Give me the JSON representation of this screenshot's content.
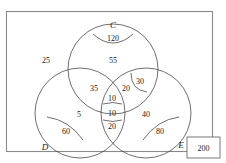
{
  "diagram": {
    "type": "venn-three-set",
    "universe_label": "",
    "sets": [
      {
        "id": "C",
        "label": "C",
        "label_x": 113,
        "label_y": 28
      },
      {
        "id": "D",
        "label": "D",
        "label_x": 45,
        "label_y": 150
      },
      {
        "id": "E",
        "label": "E",
        "label_x": 181,
        "label_y": 148
      }
    ],
    "outside_value": "25",
    "outside_x": 46,
    "outside_y": 63,
    "total_box": {
      "value": "200",
      "x": 187,
      "y": 137,
      "width": 33,
      "height": 21
    },
    "regions": [
      {
        "name": "c-cap",
        "value": "120",
        "x": 113,
        "y": 40
      },
      {
        "name": "c-only",
        "value": "55",
        "x": 113,
        "y": 62
      },
      {
        "name": "c-and-d",
        "value": "35",
        "x": 94,
        "y": 89
      },
      {
        "name": "c-and-e-mid",
        "value": "20",
        "x": 125,
        "y": 89
      },
      {
        "name": "c-and-e-cap",
        "value": "30",
        "x": 140,
        "y": 83
      },
      {
        "name": "triple-upper",
        "value": "10",
        "x": 112,
        "y": 98
      },
      {
        "name": "triple-lower",
        "value": "10",
        "x": 112,
        "y": 113
      },
      {
        "name": "d-and-e",
        "value": "20",
        "x": 112,
        "y": 126
      },
      {
        "name": "d-only",
        "value": "5",
        "x": 79,
        "y": 114
      },
      {
        "name": "e-only",
        "value": "40",
        "x": 145,
        "y": 114
      },
      {
        "name": "d-cap",
        "value": "60",
        "x": 66,
        "y": 132
      },
      {
        "name": "e-cap",
        "value": "80",
        "x": 159,
        "y": 132
      }
    ]
  }
}
